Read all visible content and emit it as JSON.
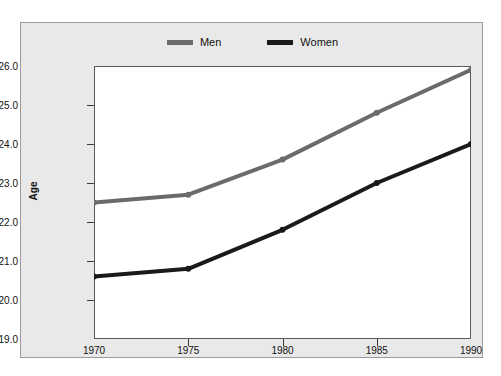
{
  "chart_data": {
    "type": "line",
    "title": "",
    "xlabel": "",
    "ylabel": "Age",
    "x": [
      1970,
      1975,
      1980,
      1985,
      1990
    ],
    "categories": [
      "1970",
      "1975",
      "1980",
      "1985",
      "1990"
    ],
    "series": [
      {
        "name": "Men",
        "color": "#6b6b6b",
        "values": [
          22.5,
          22.7,
          23.6,
          24.8,
          25.9
        ]
      },
      {
        "name": "Women",
        "color": "#1a1a1a",
        "values": [
          20.6,
          20.8,
          21.8,
          23.0,
          24.0
        ]
      }
    ],
    "ylim": [
      19.0,
      26.0
    ],
    "ytick_labels": [
      "19.0",
      "20.0",
      "21.0",
      "22.0",
      "23.0",
      "24.0",
      "25.0",
      "26.0"
    ],
    "ytick_values": [
      19.0,
      20.0,
      21.0,
      22.0,
      23.0,
      24.0,
      25.0,
      26.0
    ],
    "xlim": [
      1970,
      1990
    ],
    "xtick_labels": [
      "1970",
      "1975",
      "1980",
      "1985",
      "1990"
    ],
    "xtick_values": [
      1970,
      1975,
      1980,
      1985,
      1990
    ],
    "grid": false,
    "legend_position": "top-center",
    "markers": true
  },
  "legend": {
    "entries": [
      {
        "label": "Men",
        "color": "#6b6b6b"
      },
      {
        "label": "Women",
        "color": "#1a1a1a"
      }
    ]
  },
  "figure": {
    "background": "#e9e9e9",
    "plot_background": "#ffffff",
    "border_color": "#9a9a9a"
  }
}
